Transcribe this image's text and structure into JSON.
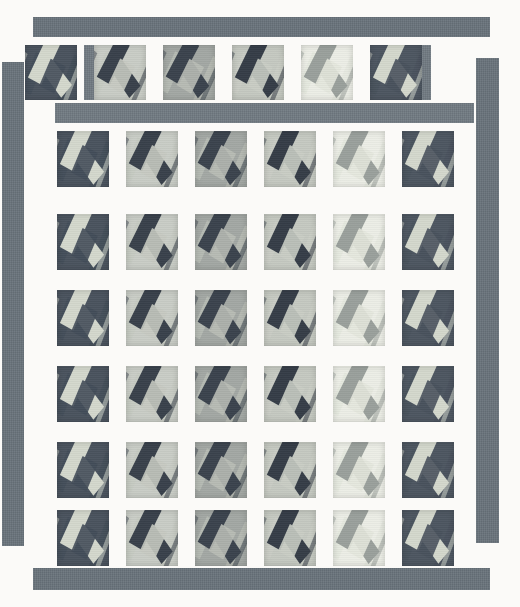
{
  "artwork": {
    "title": "Quilt Block Layout",
    "type": "quilt-grid",
    "canvas": {
      "width": 520,
      "height": 607,
      "background": "#fbfaf8"
    },
    "palette": {
      "sashing": "#6f7880",
      "border": "#69737b",
      "block_dark": "#4a535e",
      "block_darker": "#3f4852",
      "block_light": "#c9cdc6",
      "block_mid": "#9aa0a0",
      "block_cream": "#eceee6",
      "motif_light": "#d9dcd2",
      "motif_dark": "#2e3640",
      "motif_mid": "#8d9492",
      "background": "#fbfaf8"
    },
    "grid": {
      "columns": 6,
      "rows": 7,
      "block_size": 52,
      "column_gap": 17,
      "row_gap": 18
    },
    "borders": [
      {
        "name": "top-border",
        "x": 33,
        "y": 17,
        "w": 457,
        "h": 20,
        "tone": "dark"
      },
      {
        "name": "left-border",
        "x": 2,
        "y": 62,
        "w": 22,
        "h": 484,
        "tone": "dark"
      },
      {
        "name": "right-border",
        "x": 476,
        "y": 58,
        "w": 23,
        "h": 485,
        "tone": "dark"
      },
      {
        "name": "bottom-border",
        "x": 33,
        "y": 568,
        "w": 457,
        "h": 22,
        "tone": "dark"
      }
    ],
    "sashing": [
      {
        "name": "sashing-row-1",
        "x": 55,
        "y": 103,
        "w": 419,
        "h": 20
      },
      {
        "name": "sashing-top-col-1",
        "x": 84,
        "y": 45,
        "w": 19,
        "h": 55
      },
      {
        "name": "sashing-top-col-2",
        "x": 166,
        "y": 45,
        "w": 19,
        "h": 55
      },
      {
        "name": "sashing-top-col-3",
        "x": 248,
        "y": 45,
        "w": 19,
        "h": 55
      },
      {
        "name": "sashing-top-col-4",
        "x": 330,
        "y": 45,
        "w": 19,
        "h": 55
      },
      {
        "name": "sashing-top-col-5",
        "x": 412,
        "y": 45,
        "w": 19,
        "h": 55
      }
    ],
    "rows": [
      {
        "name": "row-1",
        "y": 45,
        "height": 55,
        "offset_x": 25,
        "blocks": [
          {
            "tone": "dark",
            "rotate": -22,
            "bg": "#4a535e",
            "arm": "#d4d8cd",
            "cross": "#434d59"
          },
          {
            "tone": "light",
            "rotate": -20,
            "bg": "#c9cdc6",
            "arm": "#39414b",
            "cross": "#c6cac1"
          },
          {
            "tone": "mid",
            "rotate": -19,
            "bg": "#a3a8a4",
            "arm": "#3b434d",
            "cross": "#b9bdb6"
          },
          {
            "tone": "light",
            "rotate": -21,
            "bg": "#c5c9c1",
            "arm": "#353d47",
            "cross": "#c9cdc4"
          },
          {
            "tone": "cream",
            "rotate": -20,
            "bg": "#eceee6",
            "arm": "#9aa09c",
            "cross": "#e4e7dd"
          },
          {
            "tone": "dark",
            "rotate": -22,
            "bg": "#4d5661",
            "arm": "#d4d8cd",
            "cross": "#49525d"
          }
        ]
      },
      {
        "name": "row-2",
        "y": 131,
        "height": 56,
        "offset_x": 57,
        "blocks": [
          {
            "tone": "dark",
            "rotate": -22,
            "bg": "#4a535e",
            "arm": "#d4d8cd",
            "cross": "#434d59"
          },
          {
            "tone": "light",
            "rotate": -20,
            "bg": "#c9cdc6",
            "arm": "#39414b",
            "cross": "#c6cac1"
          },
          {
            "tone": "mid",
            "rotate": -19,
            "bg": "#a3a8a4",
            "arm": "#3b434d",
            "cross": "#b9bdb6"
          },
          {
            "tone": "light",
            "rotate": -21,
            "bg": "#c5c9c1",
            "arm": "#353d47",
            "cross": "#c9cdc4"
          },
          {
            "tone": "cream",
            "rotate": -20,
            "bg": "#eceee6",
            "arm": "#9aa09c",
            "cross": "#e4e7dd"
          },
          {
            "tone": "dark",
            "rotate": -22,
            "bg": "#4d5661",
            "arm": "#d4d8cd",
            "cross": "#49525d"
          }
        ]
      },
      {
        "name": "row-3",
        "y": 214,
        "height": 56,
        "offset_x": 57,
        "blocks": [
          {
            "tone": "dark",
            "rotate": -22,
            "bg": "#4a535e",
            "arm": "#d4d8cd",
            "cross": "#434d59"
          },
          {
            "tone": "light",
            "rotate": -20,
            "bg": "#c9cdc6",
            "arm": "#39414b",
            "cross": "#c6cac1"
          },
          {
            "tone": "mid",
            "rotate": -19,
            "bg": "#a3a8a4",
            "arm": "#3b434d",
            "cross": "#b9bdb6"
          },
          {
            "tone": "light",
            "rotate": -21,
            "bg": "#c5c9c1",
            "arm": "#353d47",
            "cross": "#c9cdc4"
          },
          {
            "tone": "cream",
            "rotate": -20,
            "bg": "#eceee6",
            "arm": "#9aa09c",
            "cross": "#e4e7dd"
          },
          {
            "tone": "dark",
            "rotate": -22,
            "bg": "#4d5661",
            "arm": "#d4d8cd",
            "cross": "#49525d"
          }
        ]
      },
      {
        "name": "row-4",
        "y": 290,
        "height": 56,
        "offset_x": 57,
        "blocks": [
          {
            "tone": "dark",
            "rotate": -22,
            "bg": "#4a535e",
            "arm": "#d4d8cd",
            "cross": "#434d59"
          },
          {
            "tone": "light",
            "rotate": -20,
            "bg": "#c9cdc6",
            "arm": "#39414b",
            "cross": "#c6cac1"
          },
          {
            "tone": "mid",
            "rotate": -19,
            "bg": "#a3a8a4",
            "arm": "#3b434d",
            "cross": "#b9bdb6"
          },
          {
            "tone": "light",
            "rotate": -21,
            "bg": "#c5c9c1",
            "arm": "#353d47",
            "cross": "#c9cdc4"
          },
          {
            "tone": "cream",
            "rotate": -20,
            "bg": "#eceee6",
            "arm": "#9aa09c",
            "cross": "#e4e7dd"
          },
          {
            "tone": "dark",
            "rotate": -22,
            "bg": "#4d5661",
            "arm": "#d4d8cd",
            "cross": "#49525d"
          }
        ]
      },
      {
        "name": "row-5",
        "y": 366,
        "height": 56,
        "offset_x": 57,
        "blocks": [
          {
            "tone": "dark",
            "rotate": -22,
            "bg": "#4a535e",
            "arm": "#d4d8cd",
            "cross": "#434d59"
          },
          {
            "tone": "light",
            "rotate": -20,
            "bg": "#c9cdc6",
            "arm": "#39414b",
            "cross": "#c6cac1"
          },
          {
            "tone": "mid",
            "rotate": -19,
            "bg": "#a3a8a4",
            "arm": "#3b434d",
            "cross": "#b9bdb6"
          },
          {
            "tone": "light",
            "rotate": -21,
            "bg": "#c5c9c1",
            "arm": "#353d47",
            "cross": "#c9cdc4"
          },
          {
            "tone": "cream",
            "rotate": -20,
            "bg": "#eceee6",
            "arm": "#9aa09c",
            "cross": "#e4e7dd"
          },
          {
            "tone": "dark",
            "rotate": -22,
            "bg": "#4d5661",
            "arm": "#d4d8cd",
            "cross": "#49525d"
          }
        ]
      },
      {
        "name": "row-6",
        "y": 442,
        "height": 56,
        "offset_x": 57,
        "blocks": [
          {
            "tone": "dark",
            "rotate": -22,
            "bg": "#4a535e",
            "arm": "#d4d8cd",
            "cross": "#434d59"
          },
          {
            "tone": "light",
            "rotate": -20,
            "bg": "#c9cdc6",
            "arm": "#39414b",
            "cross": "#c6cac1"
          },
          {
            "tone": "mid",
            "rotate": -19,
            "bg": "#a3a8a4",
            "arm": "#3b434d",
            "cross": "#b9bdb6"
          },
          {
            "tone": "light",
            "rotate": -21,
            "bg": "#c5c9c1",
            "arm": "#353d47",
            "cross": "#c9cdc4"
          },
          {
            "tone": "cream",
            "rotate": -20,
            "bg": "#eceee6",
            "arm": "#9aa09c",
            "cross": "#e4e7dd"
          },
          {
            "tone": "dark",
            "rotate": -22,
            "bg": "#4d5661",
            "arm": "#d4d8cd",
            "cross": "#49525d"
          }
        ]
      },
      {
        "name": "row-7",
        "y": 510,
        "height": 56,
        "offset_x": 57,
        "blocks": [
          {
            "tone": "dark",
            "rotate": -22,
            "bg": "#4a535e",
            "arm": "#d4d8cd",
            "cross": "#434d59"
          },
          {
            "tone": "light",
            "rotate": -20,
            "bg": "#c9cdc6",
            "arm": "#39414b",
            "cross": "#c6cac1"
          },
          {
            "tone": "mid",
            "rotate": -19,
            "bg": "#a3a8a4",
            "arm": "#3b434d",
            "cross": "#b9bdb6"
          },
          {
            "tone": "light",
            "rotate": -21,
            "bg": "#c5c9c1",
            "arm": "#353d47",
            "cross": "#c9cdc4"
          },
          {
            "tone": "cream",
            "rotate": -20,
            "bg": "#eceee6",
            "arm": "#9aa09c",
            "cross": "#e4e7dd"
          },
          {
            "tone": "dark",
            "rotate": -22,
            "bg": "#4d5661",
            "arm": "#d4d8cd",
            "cross": "#49525d"
          }
        ]
      }
    ]
  }
}
